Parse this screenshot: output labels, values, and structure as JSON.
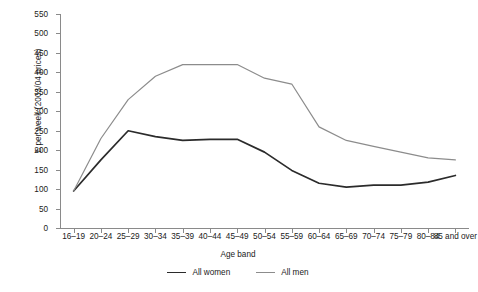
{
  "chart_data": {
    "type": "line",
    "title": "",
    "xlabel": "Age band",
    "ylabel": "£ per week (2003/04 prices)",
    "ylim": [
      0,
      550
    ],
    "yticks": [
      0,
      50,
      100,
      150,
      200,
      250,
      300,
      350,
      400,
      450,
      500,
      550
    ],
    "grid": false,
    "legend_position": "bottom",
    "categories": [
      "16–19",
      "20–24",
      "25–29",
      "30–34",
      "35–39",
      "40–44",
      "45–49",
      "50–54",
      "55–59",
      "60–64",
      "65–69",
      "70–74",
      "75–79",
      "80–84",
      "85 and over"
    ],
    "series": [
      {
        "name": "All women",
        "color": "#2b2b2b",
        "values": [
          95,
          175,
          250,
          235,
          225,
          228,
          228,
          195,
          148,
          115,
          105,
          110,
          110,
          118,
          135
        ]
      },
      {
        "name": "All men",
        "color": "#8c8c8c",
        "values": [
          95,
          230,
          330,
          390,
          420,
          420,
          420,
          385,
          370,
          260,
          225,
          210,
          195,
          180,
          175
        ]
      }
    ]
  },
  "axis": {
    "y_title": "£ per week (2003/04 prices)",
    "x_title": "Age band"
  },
  "legend": {
    "items": [
      {
        "label": "All women"
      },
      {
        "label": "All men"
      }
    ]
  }
}
